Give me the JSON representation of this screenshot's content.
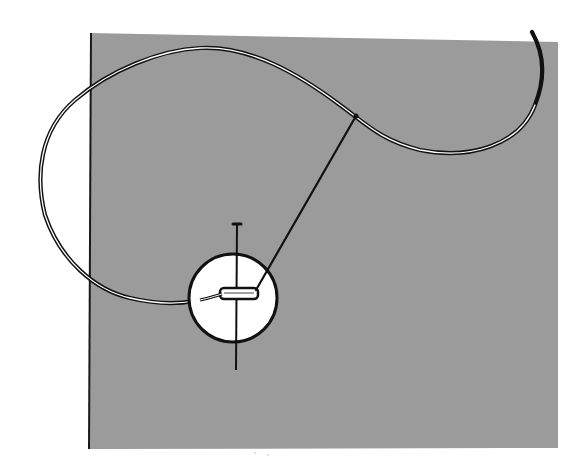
{
  "illustration": {
    "subject": "sewing a button onto fabric",
    "colors": {
      "background": "#ffffff",
      "fabric": "#9b9b9b",
      "fabric_edge": "#1a1a1a",
      "button": "#ffffff",
      "ink": "#111111",
      "thread_highlight": "#ffffff"
    },
    "elements": [
      "fabric-swatch",
      "button",
      "pin",
      "thread",
      "needle"
    ]
  }
}
